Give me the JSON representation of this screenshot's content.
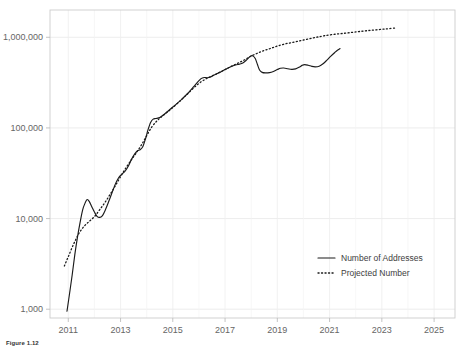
{
  "chart_data": {
    "type": "line",
    "title": "",
    "xlabel": "",
    "ylabel": "",
    "yscale": "log",
    "xlim": [
      2010.3,
      2025.8
    ],
    "ylim": [
      800,
      2000000
    ],
    "grid": true,
    "legend_position": "bottom-right",
    "y_ticks": [
      1000,
      10000,
      100000,
      1000000
    ],
    "y_tick_labels": [
      "1,000",
      "10,000",
      "100,000",
      "1,000,000"
    ],
    "x_ticks": [
      2011,
      2013,
      2015,
      2017,
      2019,
      2021,
      2023,
      2025
    ],
    "x_tick_labels": [
      "2011",
      "2013",
      "2015",
      "2017",
      "2019",
      "2021",
      "2023",
      "2025"
    ],
    "x_minor_gridlines": [
      2012,
      2014,
      2016,
      2018,
      2020,
      2022,
      2024
    ],
    "series": [
      {
        "name": "Number of Addresses",
        "style": "solid",
        "color": "#1a1a1a",
        "points": [
          [
            2010.95,
            950
          ],
          [
            2011.05,
            1500
          ],
          [
            2011.15,
            2400
          ],
          [
            2011.25,
            4000
          ],
          [
            2011.35,
            6200
          ],
          [
            2011.45,
            9000
          ],
          [
            2011.55,
            12500
          ],
          [
            2011.65,
            15000
          ],
          [
            2011.72,
            16200
          ],
          [
            2011.8,
            15500
          ],
          [
            2011.9,
            13500
          ],
          [
            2012.0,
            11800
          ],
          [
            2012.1,
            10600
          ],
          [
            2012.2,
            10300
          ],
          [
            2012.3,
            10700
          ],
          [
            2012.42,
            12500
          ],
          [
            2012.55,
            15500
          ],
          [
            2012.68,
            19500
          ],
          [
            2012.8,
            24000
          ],
          [
            2012.92,
            28000
          ],
          [
            2013.0,
            30000
          ],
          [
            2013.08,
            31500
          ],
          [
            2013.18,
            33500
          ],
          [
            2013.3,
            38000
          ],
          [
            2013.42,
            45000
          ],
          [
            2013.55,
            52000
          ],
          [
            2013.65,
            56000
          ],
          [
            2013.75,
            57500
          ],
          [
            2013.85,
            62000
          ],
          [
            2013.95,
            75000
          ],
          [
            2014.05,
            95000
          ],
          [
            2014.15,
            115000
          ],
          [
            2014.25,
            125000
          ],
          [
            2014.35,
            127000
          ],
          [
            2014.5,
            130000
          ],
          [
            2014.65,
            140000
          ],
          [
            2014.8,
            152000
          ],
          [
            2015.0,
            170000
          ],
          [
            2015.2,
            190000
          ],
          [
            2015.4,
            215000
          ],
          [
            2015.6,
            245000
          ],
          [
            2015.8,
            285000
          ],
          [
            2015.95,
            320000
          ],
          [
            2016.08,
            350000
          ],
          [
            2016.2,
            360000
          ],
          [
            2016.32,
            358000
          ],
          [
            2016.45,
            365000
          ],
          [
            2016.6,
            385000
          ],
          [
            2016.8,
            410000
          ],
          [
            2017.0,
            440000
          ],
          [
            2017.2,
            470000
          ],
          [
            2017.4,
            495000
          ],
          [
            2017.55,
            505000
          ],
          [
            2017.68,
            520000
          ],
          [
            2017.8,
            555000
          ],
          [
            2017.92,
            600000
          ],
          [
            2018.0,
            625000
          ],
          [
            2018.08,
            620000
          ],
          [
            2018.16,
            580000
          ],
          [
            2018.24,
            500000
          ],
          [
            2018.32,
            435000
          ],
          [
            2018.42,
            410000
          ],
          [
            2018.55,
            405000
          ],
          [
            2018.7,
            408000
          ],
          [
            2018.85,
            420000
          ],
          [
            2019.0,
            440000
          ],
          [
            2019.12,
            455000
          ],
          [
            2019.25,
            458000
          ],
          [
            2019.4,
            450000
          ],
          [
            2019.55,
            443000
          ],
          [
            2019.7,
            448000
          ],
          [
            2019.85,
            470000
          ],
          [
            2019.95,
            490000
          ],
          [
            2020.05,
            500000
          ],
          [
            2020.18,
            492000
          ],
          [
            2020.32,
            478000
          ],
          [
            2020.45,
            472000
          ],
          [
            2020.6,
            480000
          ],
          [
            2020.75,
            510000
          ],
          [
            2020.9,
            560000
          ],
          [
            2021.05,
            620000
          ],
          [
            2021.2,
            680000
          ],
          [
            2021.3,
            720000
          ],
          [
            2021.4,
            750000
          ]
        ]
      },
      {
        "name": "Projected Number",
        "style": "dotted",
        "color": "#1a1a1a",
        "points": [
          [
            2010.85,
            3000
          ],
          [
            2011.0,
            3800
          ],
          [
            2011.2,
            5200
          ],
          [
            2011.4,
            6800
          ],
          [
            2011.6,
            8200
          ],
          [
            2011.8,
            9300
          ],
          [
            2012.0,
            10500
          ],
          [
            2012.2,
            12500
          ],
          [
            2012.4,
            15000
          ],
          [
            2012.6,
            18500
          ],
          [
            2012.8,
            23000
          ],
          [
            2013.0,
            29000
          ],
          [
            2013.2,
            36000
          ],
          [
            2013.4,
            44000
          ],
          [
            2013.6,
            53000
          ],
          [
            2013.8,
            65000
          ],
          [
            2014.0,
            82000
          ],
          [
            2014.2,
            103000
          ],
          [
            2014.4,
            120000
          ],
          [
            2014.6,
            135000
          ],
          [
            2014.8,
            150000
          ],
          [
            2015.0,
            168000
          ],
          [
            2015.25,
            195000
          ],
          [
            2015.5,
            228000
          ],
          [
            2015.75,
            268000
          ],
          [
            2016.0,
            310000
          ],
          [
            2016.25,
            345000
          ],
          [
            2016.5,
            375000
          ],
          [
            2016.75,
            405000
          ],
          [
            2017.0,
            440000
          ],
          [
            2017.25,
            480000
          ],
          [
            2017.5,
            520000
          ],
          [
            2017.75,
            565000
          ],
          [
            2018.0,
            620000
          ],
          [
            2018.25,
            670000
          ],
          [
            2018.5,
            715000
          ],
          [
            2018.75,
            755000
          ],
          [
            2019.0,
            800000
          ],
          [
            2019.3,
            845000
          ],
          [
            2019.6,
            880000
          ],
          [
            2019.9,
            920000
          ],
          [
            2020.2,
            960000
          ],
          [
            2020.5,
            1000000
          ],
          [
            2020.8,
            1040000
          ],
          [
            2021.2,
            1080000
          ],
          [
            2021.6,
            1110000
          ],
          [
            2022.0,
            1145000
          ],
          [
            2022.4,
            1180000
          ],
          [
            2022.8,
            1210000
          ],
          [
            2023.2,
            1240000
          ],
          [
            2023.5,
            1265000
          ]
        ]
      }
    ]
  },
  "legend": {
    "items": [
      {
        "label": "Number of Addresses",
        "style": "solid"
      },
      {
        "label": "Projected Number",
        "style": "dotted"
      }
    ]
  },
  "caption": {
    "label": "Figure 1.12",
    "text": ""
  }
}
